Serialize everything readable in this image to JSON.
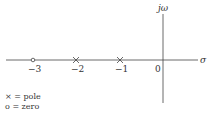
{
  "diagram": {
    "type": "pole-zero plot",
    "axes": {
      "real_label": "σ",
      "imag_label": "jω",
      "origin_label": "0"
    },
    "points": [
      {
        "kind": "zero",
        "value": -3,
        "label": "−3"
      },
      {
        "kind": "pole",
        "value": -2,
        "label": "−2"
      },
      {
        "kind": "pole",
        "value": -1,
        "label": "−1"
      }
    ],
    "legend": [
      {
        "symbol": "×",
        "text": "= pole"
      },
      {
        "symbol": "o",
        "text": "= zero"
      }
    ]
  }
}
